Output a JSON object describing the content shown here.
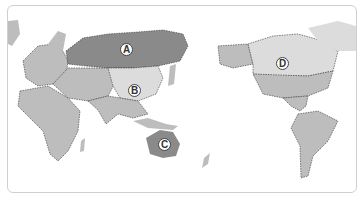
{
  "map": {
    "type": "world-political-pacific-centered",
    "colors": {
      "land_default": "#bdbdbd",
      "highlight_dark": "#8a8a8a",
      "highlight_light": "#dcdcdc",
      "ocean": "#ffffff",
      "border": "#333333"
    },
    "labels": [
      {
        "id": "A",
        "text": "A",
        "region": "Russia",
        "shade": "dark"
      },
      {
        "id": "B",
        "text": "B",
        "region": "China",
        "shade": "light"
      },
      {
        "id": "C",
        "text": "C",
        "region": "Australia",
        "shade": "dark"
      },
      {
        "id": "D",
        "text": "D",
        "region": "Canada",
        "shade": "light"
      }
    ]
  }
}
